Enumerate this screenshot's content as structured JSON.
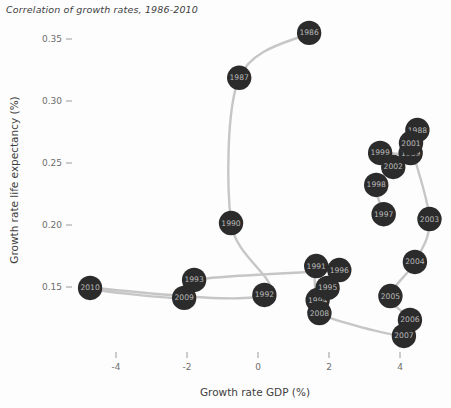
{
  "chart_data": {
    "type": "scatter",
    "title": "Correlation of growth rates, 1986-2010",
    "xlabel": "Growth rate GDP (%)",
    "ylabel": "Growth rate life expectancy (%)",
    "xlim": [
      -5.2,
      5.0
    ],
    "ylim": [
      0.128,
      0.372
    ],
    "xticks": [
      -4,
      -2,
      0,
      2,
      4
    ],
    "xtick_labels": [
      "-4",
      "-2",
      "0",
      "2",
      "4"
    ],
    "yticks": [
      0.15,
      0.2,
      0.25,
      0.3,
      0.35
    ],
    "ytick_labels": [
      "0.15",
      "0.20",
      "0.25",
      "0.30",
      "0.35"
    ],
    "grid": false,
    "legend": "none",
    "connected": true,
    "marker_color": "#2b2b2b",
    "line_color": "#c6c6c6",
    "label_color": "#b9b9b9",
    "points": [
      {
        "label": "1986",
        "x": 1.44,
        "y": 0.3549
      },
      {
        "label": "1987",
        "x": -0.53,
        "y": 0.3187
      },
      {
        "label": "1988",
        "x": 4.49,
        "y": 0.2766
      },
      {
        "label": "1989",
        "x": 4.3,
        "y": 0.258
      },
      {
        "label": "1990",
        "x": -0.76,
        "y": 0.2016
      },
      {
        "label": "1991",
        "x": 1.64,
        "y": 0.1669
      },
      {
        "label": "1992",
        "x": 0.18,
        "y": 0.1436
      },
      {
        "label": "1993",
        "x": -1.8,
        "y": 0.1557
      },
      {
        "label": "1994",
        "x": 1.68,
        "y": 0.1395
      },
      {
        "label": "1995",
        "x": 1.96,
        "y": 0.1492
      },
      {
        "label": "1996",
        "x": 2.29,
        "y": 0.1637
      },
      {
        "label": "1997",
        "x": 3.54,
        "y": 0.2087
      },
      {
        "label": "1998",
        "x": 3.33,
        "y": 0.2323
      },
      {
        "label": "1999",
        "x": 3.44,
        "y": 0.2581
      },
      {
        "label": "2001",
        "x": 4.31,
        "y": 0.2661
      },
      {
        "label": "2002",
        "x": 3.81,
        "y": 0.2468
      },
      {
        "label": "2003",
        "x": 4.83,
        "y": 0.2048
      },
      {
        "label": "2004",
        "x": 4.42,
        "y": 0.1702
      },
      {
        "label": "2005",
        "x": 3.73,
        "y": 0.1427
      },
      {
        "label": "2006",
        "x": 4.28,
        "y": 0.1234
      },
      {
        "label": "2007",
        "x": 4.11,
        "y": 0.1105
      },
      {
        "label": "2008",
        "x": 1.73,
        "y": 0.129
      },
      {
        "label": "2009",
        "x": -2.08,
        "y": 0.1412
      },
      {
        "label": "2010",
        "x": -4.73,
        "y": 0.1492
      }
    ],
    "path_order": [
      "1986",
      "1987",
      "1990",
      "1992",
      "2010",
      "2009",
      "1993",
      "1996",
      "1991",
      "1994",
      "1995",
      "2008",
      "2007",
      "2006",
      "2005",
      "2004",
      "2003",
      "2001",
      "1988",
      "1989",
      "1999",
      "2002",
      "1998",
      "1997"
    ]
  }
}
